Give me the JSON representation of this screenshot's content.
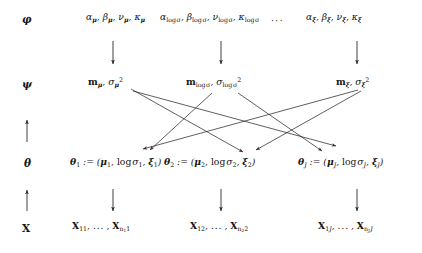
{
  "figure": {
    "type": "hierarchical-model-diagram",
    "levels": [
      {
        "id": "phi",
        "label": "φ",
        "label_name": "phi",
        "role": "fixed hyperparameters",
        "nodes": [
          {
            "id": "phi-mu",
            "text": "αμ, βμ, νμ, κμ"
          },
          {
            "id": "phi-logsigma",
            "text": "αlog σ, βlog σ, νlog σ, κlog σ"
          },
          {
            "id": "phi-xi",
            "text": "αξ, βξ, νξ, κξ"
          }
        ]
      },
      {
        "id": "psi",
        "label": "ψ",
        "label_name": "psi",
        "role": "hyperpriors",
        "nodes": [
          {
            "id": "psi-mu",
            "text": "mμ, σ²μ"
          },
          {
            "id": "psi-logsigma",
            "text": "mlog σ, σ²log σ"
          },
          {
            "id": "psi-xi",
            "text": "mξ, σ²ξ"
          }
        ]
      },
      {
        "id": "theta",
        "label": "θ",
        "label_name": "theta",
        "role": "group level parameters",
        "nodes": [
          {
            "id": "theta-1",
            "text": "θ1 := (μ1, log σ1, ξ1)"
          },
          {
            "id": "theta-2",
            "text": "θ2 := (μ2, log σ2, ξ2)"
          },
          {
            "id": "theta-J",
            "text": "θJ := (μJ, log σJ, ξJ)"
          }
        ]
      },
      {
        "id": "X",
        "label": "X",
        "label_name": "observed-data",
        "role": "observed data",
        "nodes": [
          {
            "id": "x-1",
            "text": "X11, ..., Xn1 1"
          },
          {
            "id": "x-2",
            "text": "X12, ..., Xn2 2"
          },
          {
            "id": "x-J",
            "text": "X1J, ..., XnJ J"
          }
        ]
      }
    ],
    "ellipsis": "···",
    "arrow_down_glyph": "↓",
    "arrow_up_glyph": "↑",
    "column_arrows": {
      "phi_to_psi": [
        "down",
        "down",
        "down"
      ],
      "theta_to_x": [
        "down",
        "down",
        "down"
      ],
      "left_psi_to_theta": "up",
      "left_theta_to_x": "up"
    },
    "crossing_edges": [
      {
        "from": "psi-mu",
        "to": "theta-2"
      },
      {
        "from": "psi-mu",
        "to": "theta-J"
      },
      {
        "from": "psi-logsigma",
        "to": "theta-1"
      },
      {
        "from": "psi-logsigma",
        "to": "theta-J"
      },
      {
        "from": "psi-xi",
        "to": "theta-1"
      },
      {
        "from": "psi-xi",
        "to": "theta-2"
      }
    ],
    "colors": {
      "background": "#ffffff",
      "text": "#141414",
      "edge": "#2b2b2b"
    }
  }
}
